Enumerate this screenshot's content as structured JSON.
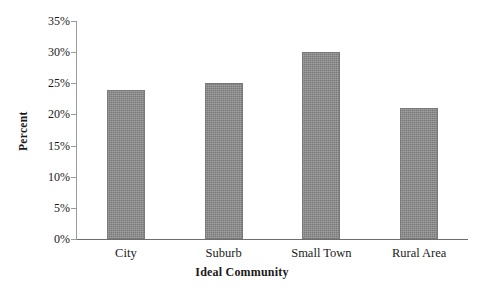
{
  "chart_data": {
    "type": "bar",
    "title": "",
    "categories": [
      "City",
      "Suburb",
      "Small Town",
      "Rural Area"
    ],
    "values": [
      24,
      25,
      30,
      21
    ],
    "value_suffix": "%",
    "xlabel": "Ideal Community",
    "ylabel": "Percent",
    "ylim": [
      0,
      35
    ],
    "ytick_step": 5,
    "ytick_labels": [
      "0%",
      "5%",
      "10%",
      "15%",
      "20%",
      "25%",
      "30%",
      "35%"
    ],
    "ytick_values": [
      0,
      5,
      10,
      15,
      20,
      25,
      30,
      35
    ],
    "grid": false,
    "legend": false,
    "legend_position": "none",
    "bar_color": "#8b8b8b",
    "bar_edge_color": "#7a7a7a",
    "axis_color": "#6e6e6e",
    "background_color": "#ffffff",
    "text_color": "#1a1a1a"
  }
}
